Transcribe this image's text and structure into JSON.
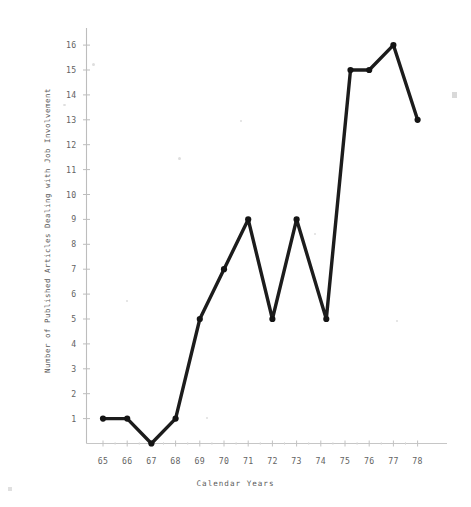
{
  "chart_data": {
    "type": "line",
    "title": "",
    "xlabel": "Calendar Years",
    "ylabel": "Number of Published Articles Dealing with Job Involvement",
    "categories": [
      "65",
      "66",
      "67",
      "68",
      "69",
      "70",
      "71",
      "72",
      "73",
      "74",
      "75",
      "76",
      "77",
      "78"
    ],
    "x": [
      65,
      66,
      67,
      68,
      69,
      70,
      71,
      72,
      73,
      74,
      75,
      76,
      77,
      78
    ],
    "values": [
      1,
      1,
      0,
      1,
      5,
      7,
      9,
      5,
      9,
      5,
      15,
      15,
      16,
      13
    ],
    "series": [
      {
        "name": "Published Articles",
        "values": [
          1,
          1,
          0,
          1,
          5,
          7,
          9,
          5,
          9,
          5,
          15,
          15,
          16,
          13
        ]
      }
    ],
    "xlim": [
      64.3,
      78.9
    ],
    "ylim": [
      0,
      16.6
    ],
    "ytick_labels": [
      "1",
      "2",
      "3",
      "4",
      "5",
      "6",
      "7",
      "8",
      "9",
      "10",
      "11",
      "12",
      "13",
      "14",
      "15",
      "16"
    ],
    "ytick_values": [
      1,
      2,
      3,
      4,
      5,
      6,
      7,
      8,
      9,
      10,
      11,
      12,
      13,
      14,
      15,
      16
    ],
    "xtick_labels": [
      "65",
      "66",
      "67",
      "68",
      "69",
      "70",
      "71",
      "72",
      "73",
      "74",
      "75",
      "76",
      "77",
      "78"
    ],
    "grid": false,
    "legend": false,
    "legend_position": "none",
    "line_color": "#1c1c1c",
    "marker": "circle",
    "axis_color": "#b9b9b9"
  },
  "axes": {
    "y_axis_title": "Number of Published Articles Dealing with Job Involvement",
    "x_axis_title": "Calendar Years"
  }
}
